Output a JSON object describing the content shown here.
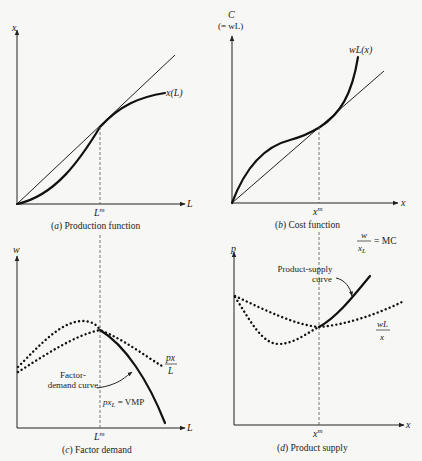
{
  "panels": {
    "a": {
      "caption_letter": "a",
      "caption_text": "Production function",
      "y_label": "x",
      "x_label": "L",
      "x_tick": "L",
      "x_tick_sup": "m",
      "curve_label": "x(L)"
    },
    "b": {
      "caption_letter": "b",
      "caption_text": "Cost function",
      "y_label": "C",
      "y_label_sub": "(= wL)",
      "x_label": "x",
      "x_tick": "x",
      "x_tick_sup": "m",
      "curve_label": "wL(x)"
    },
    "c": {
      "caption_letter": "c",
      "caption_text": "Factor demand",
      "y_label": "w",
      "x_label": "L",
      "x_tick": "L",
      "x_tick_sup": "m",
      "apl_num": "px",
      "apl_den": "L",
      "annotation_line1": "Factor-",
      "annotation_line2": "demand curve",
      "vmp_label_pre": "px",
      "vmp_label_sub": "L",
      "vmp_label_post": " = VMP"
    },
    "d": {
      "caption_letter": "d",
      "caption_text": "Product supply",
      "y_label": "p",
      "x_label": "x",
      "x_tick": "x",
      "x_tick_sup": "m",
      "mc_num": "w",
      "mc_den_pre": "x",
      "mc_den_sub": "L",
      "mc_post": "= MC",
      "ac_num": "wL",
      "ac_den": "x",
      "annotation_line1": "Product-supply",
      "annotation_line2": "curve"
    }
  }
}
